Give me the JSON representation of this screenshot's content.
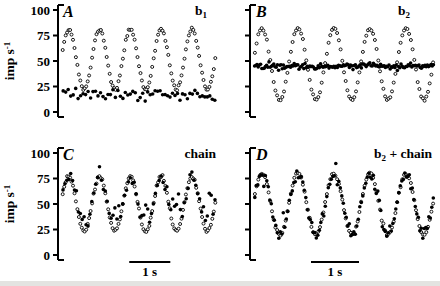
{
  "figure": {
    "background": "#ffffff",
    "ink": "#000000",
    "marker_colors": {
      "open_circle_fill": "#ffffff",
      "open_circle_stroke": "#000000",
      "filled_dot": "#000000"
    }
  },
  "chart_data": {
    "type": "scatter",
    "layout": "2x2 panels",
    "title": "",
    "xlabel": "",
    "x_axis_visible": false,
    "ylabel": {
      "text": "imp s",
      "exponent": "-1"
    },
    "ylim": [
      0,
      100
    ],
    "yticks_shared": [
      "0",
      "25",
      "50",
      "75",
      "100"
    ],
    "scalebar_label": "1 s",
    "panels": [
      {
        "letter": "A",
        "condition": {
          "pre": "b",
          "sub": "1",
          "post": ""
        },
        "ylim": [
          0,
          100
        ],
        "ytick_values": [
          0,
          25,
          50,
          75,
          100
        ],
        "ytick_labels_visible": true,
        "ylabel_visible": true,
        "duration_s": 3.75,
        "frequency_hz": 1.333,
        "series": [
          {
            "name": "stimulus",
            "marker": "open-circle",
            "model": "sine",
            "mean": 51.5,
            "amplitude": 29.5,
            "phase": 0.2,
            "jitter": 0.7,
            "points": 105,
            "seed": 11
          },
          {
            "name": "response",
            "marker": "filled-dot",
            "model": "flat",
            "mean": 17,
            "jitter": 2.6,
            "points": 62,
            "seed": 12
          }
        ],
        "scalebar": null
      },
      {
        "letter": "B",
        "condition": {
          "pre": "b",
          "sub": "2",
          "post": ""
        },
        "ylim": [
          0,
          100
        ],
        "ytick_values": [
          0,
          25,
          50,
          75,
          100
        ],
        "ytick_labels_visible": false,
        "ylabel_visible": false,
        "duration_s": 3.75,
        "frequency_hz": 1.333,
        "series": [
          {
            "name": "stimulus",
            "marker": "open-circle",
            "model": "sine",
            "mean": 47,
            "amplitude": 35,
            "phase": 0.2,
            "jitter": 0.8,
            "points": 105,
            "seed": 21
          },
          {
            "name": "response",
            "marker": "filled-dot",
            "model": "flat",
            "mean": 45,
            "jitter": 1.3,
            "points": 150,
            "seed": 22
          }
        ],
        "scalebar": null
      },
      {
        "letter": "C",
        "condition": {
          "pre": "chain",
          "sub": "",
          "post": ""
        },
        "ylim": [
          0,
          100
        ],
        "ytick_values": [
          0,
          25,
          50,
          75,
          100
        ],
        "ytick_labels_visible": true,
        "ylabel_visible": true,
        "duration_s": 3.75,
        "frequency_hz": 1.333,
        "series": [
          {
            "name": "stimulus",
            "marker": "open-circle",
            "model": "sine",
            "mean": 50,
            "amplitude": 27,
            "phase": 0.2,
            "jitter": 0.8,
            "points": 105,
            "seed": 31
          },
          {
            "name": "response",
            "marker": "filled-dot",
            "model": "follow",
            "mean": 50,
            "amplitude": 27,
            "phase": 0.2,
            "floor": 39,
            "floor_jitter": 4.5,
            "jitter": 3.2,
            "outlier_rate": 0.09,
            "outlier_boost": 15,
            "points": 80,
            "seed": 32
          }
        ],
        "scalebar": {
          "label": "1 s",
          "seconds": 1,
          "center_frac": 0.57
        }
      },
      {
        "letter": "D",
        "condition": {
          "pre": "b",
          "sub": "2",
          "post": " + chain"
        },
        "ylim": [
          0,
          100
        ],
        "ytick_values": [
          0,
          25,
          50,
          75,
          100
        ],
        "ytick_labels_visible": false,
        "ylabel_visible": false,
        "duration_s": 3.75,
        "frequency_hz": 1.333,
        "series": [
          {
            "name": "stimulus",
            "marker": "open-circle",
            "model": "sine",
            "mean": 50,
            "amplitude": 30,
            "phase": 0.2,
            "jitter": 0.8,
            "points": 105,
            "seed": 41
          },
          {
            "name": "response",
            "marker": "filled-dot",
            "model": "follow",
            "mean": 50,
            "amplitude": 30,
            "phase": 0.2,
            "floor": null,
            "floor_jitter": 0,
            "jitter": 3.4,
            "outlier_rate": 0.07,
            "outlier_boost": 13,
            "points": 120,
            "seed": 42
          }
        ],
        "scalebar": {
          "label": "1 s",
          "seconds": 1,
          "center_frac": 0.45
        }
      }
    ]
  }
}
